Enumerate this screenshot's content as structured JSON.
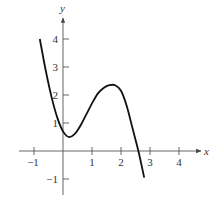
{
  "chart_data": {
    "type": "line",
    "title": "",
    "xlabel": "x",
    "ylabel": "y",
    "xlim": [
      -1.2,
      4.8
    ],
    "ylim": [
      -1.5,
      4.8
    ],
    "x_ticks": [
      -1,
      1,
      2,
      3,
      4
    ],
    "x_tick_labels": [
      "-1",
      "1",
      "2",
      "3",
      "4"
    ],
    "y_ticks": [
      -1,
      1,
      2,
      3,
      4
    ],
    "y_tick_labels": [
      "-1",
      "1",
      "2",
      "3",
      "4"
    ],
    "grid": false,
    "legend": null,
    "series": [
      {
        "name": "f(x)",
        "x": [
          -0.8,
          -0.6,
          -0.4,
          -0.2,
          0.0,
          0.2,
          0.4,
          0.6,
          0.8,
          1.0,
          1.2,
          1.4,
          1.6,
          1.8,
          2.0,
          2.2,
          2.4,
          2.6,
          2.8
        ],
        "y": [
          4.0,
          2.9,
          1.95,
          1.2,
          0.7,
          0.5,
          0.6,
          0.9,
          1.3,
          1.7,
          2.05,
          2.25,
          2.35,
          2.35,
          2.15,
          1.6,
          0.8,
          0.0,
          -0.95
        ]
      }
    ]
  }
}
